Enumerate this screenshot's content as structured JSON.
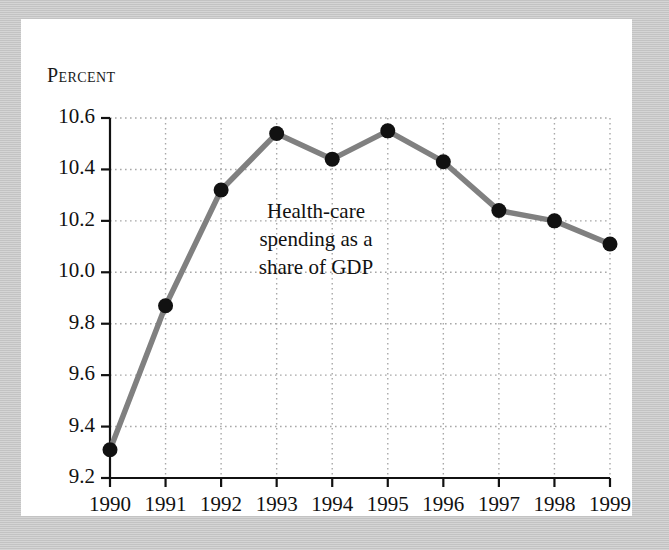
{
  "figure": {
    "axis_title": "Percent",
    "frame_color": "#c9c9c9",
    "card_color": "#ffffff",
    "line_color": "#808080",
    "marker_color": "#111111",
    "grid_color": "#a8a8a8",
    "axis_color": "#111111"
  },
  "annotation": {
    "line1": "Health-care",
    "line2": "spending as a",
    "line3": "share of GDP"
  },
  "chart_data": {
    "type": "line",
    "title": "",
    "subtitle": "",
    "xlabel": "",
    "ylabel": "Percent",
    "categories": [
      "1990",
      "1991",
      "1992",
      "1993",
      "1994",
      "1995",
      "1996",
      "1997",
      "1998",
      "1999"
    ],
    "values": [
      9.31,
      9.87,
      10.32,
      10.54,
      10.44,
      10.55,
      10.43,
      10.24,
      10.2,
      10.11
    ],
    "series": [
      {
        "name": "Health-care spending as a share of GDP",
        "values": [
          9.31,
          9.87,
          10.32,
          10.54,
          10.44,
          10.55,
          10.43,
          10.24,
          10.2,
          10.11
        ]
      }
    ],
    "ylim": [
      9.2,
      10.6
    ],
    "ytick_labels": [
      "10.6",
      "10.4",
      "10.2",
      "10.0",
      "9.8",
      "9.6",
      "9.4",
      "9.2"
    ],
    "ytick_values": [
      10.6,
      10.4,
      10.2,
      10.0,
      9.8,
      9.6,
      9.4,
      9.2
    ],
    "xtick_labels": [
      "1990",
      "1991",
      "1992",
      "1993",
      "1994",
      "1995",
      "1996",
      "1997",
      "1998",
      "1999"
    ],
    "grid": true,
    "grid_style": "dotted",
    "legend": false,
    "legend_position": "none",
    "annotations": [
      "Health-care spending as a share of GDP"
    ]
  }
}
